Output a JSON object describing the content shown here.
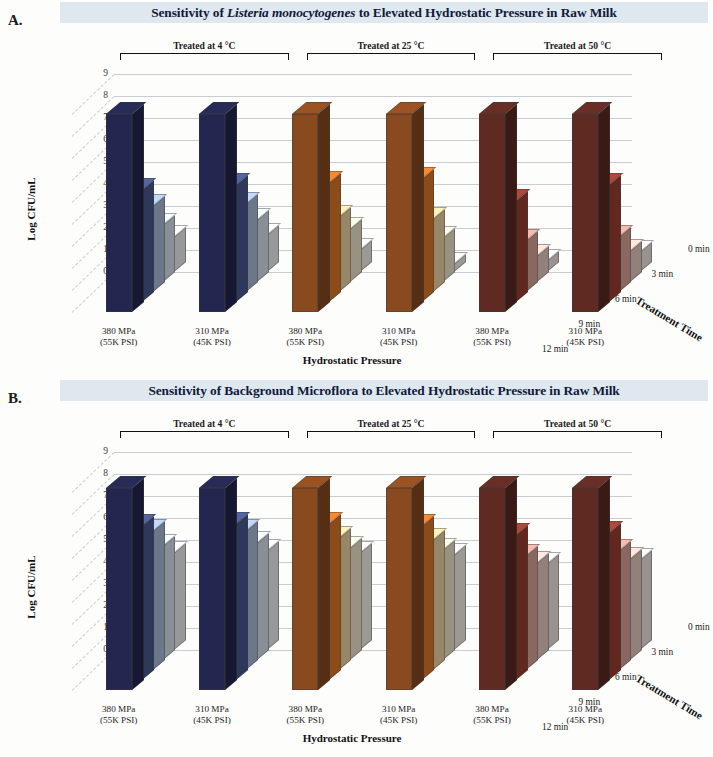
{
  "panels": [
    {
      "letter": "A.",
      "title_pre": "Sensitivity of ",
      "title_italic": "Listeria monocytogenes",
      "title_post": " to Elevated Hydrostatic Pressure in Raw Milk"
    },
    {
      "letter": "B.",
      "title_pre": "Sensitivity of Background Microflora to Elevated Hydrostatic Pressure in Raw Milk",
      "title_italic": "",
      "title_post": ""
    }
  ],
  "axes": {
    "y_title": "Log CFU/mL",
    "y_ticks": [
      "9",
      "8",
      "7",
      "6",
      "5",
      "4",
      "3",
      "2",
      "1",
      "0"
    ],
    "x_title": "Hydrostatic Pressure",
    "x_labels": [
      {
        "line1": "380 MPa",
        "line2": "(55K PSI)"
      },
      {
        "line1": "310 MPa",
        "line2": "(45K PSI)"
      },
      {
        "line1": "380 MPa",
        "line2": "(55K PSI)"
      },
      {
        "line1": "310 MPa",
        "line2": "(45K PSI)"
      },
      {
        "line1": "380 MPa",
        "line2": "(55K PSI)"
      },
      {
        "line1": "310 MPa",
        "line2": "(45K PSI)"
      }
    ],
    "z_title": "Treatment Time",
    "z_labels": [
      "0 min",
      "3 min",
      "6 min",
      "9 min",
      "12 min"
    ]
  },
  "temperature_groups": [
    {
      "label": "Treated at 4 °C"
    },
    {
      "label": "Treated at 25 °C"
    },
    {
      "label": "Treated at 50 °C"
    }
  ],
  "colors": {
    "title_band": "#dfe7ef",
    "title_text": "#101a3a",
    "grid": "#c9ccd2",
    "series_4C": [
      "#23264f",
      "#4a5a91",
      "#aec2de",
      "#dde7f2",
      "#f2f5f8"
    ],
    "series_25C": [
      "#8a4a20",
      "#e07a2a",
      "#f3d9a8",
      "#f7ecd4",
      "#faf6ee"
    ],
    "series_50C": [
      "#5e2a22",
      "#9e4034",
      "#dba89c",
      "#eccfc6",
      "#f6ece8"
    ]
  },
  "chart_data": [
    {
      "type": "bar",
      "title": "Sensitivity of Listeria monocytogenes to Elevated Hydrostatic Pressure in Raw Milk",
      "xlabel": "Hydrostatic Pressure",
      "ylabel": "Log CFU/mL",
      "zlabel": "Treatment Time",
      "ylim": [
        0,
        9
      ],
      "grid": true,
      "categories": [
        "4 °C / 380 MPa (55K PSI)",
        "4 °C / 310 MPa (45K PSI)",
        "25 °C / 380 MPa (55K PSI)",
        "25 °C / 310 MPa (45K PSI)",
        "50 °C / 380 MPa (55K PSI)",
        "50 °C / 310 MPa (45K PSI)"
      ],
      "series": [
        {
          "name": "0 min",
          "values": [
            9.0,
            9.0,
            9.0,
            9.0,
            9.0,
            9.0
          ]
        },
        {
          "name": "3 min",
          "values": [
            5.1,
            5.3,
            5.4,
            5.6,
            4.6,
            5.3
          ]
        },
        {
          "name": "6 min",
          "values": [
            3.9,
            4.0,
            3.4,
            3.3,
            2.3,
            2.5
          ]
        },
        {
          "name": "9 min",
          "values": [
            2.6,
            2.8,
            2.4,
            2.0,
            1.2,
            1.4
          ]
        },
        {
          "name": "12 min",
          "values": [
            1.6,
            1.7,
            1.0,
            0.35,
            0.5,
            0.9
          ]
        }
      ]
    },
    {
      "type": "bar",
      "title": "Sensitivity of Background Microflora to Elevated Hydrostatic Pressure in Raw Milk",
      "xlabel": "Hydrostatic Pressure",
      "ylabel": "Log CFU/mL",
      "zlabel": "Treatment Time",
      "ylim": [
        0,
        9
      ],
      "grid": true,
      "categories": [
        "4 °C / 380 MPa (55K PSI)",
        "4 °C / 310 MPa (45K PSI)",
        "25 °C / 380 MPa (55K PSI)",
        "25 °C / 310 MPa (45K PSI)",
        "50 °C / 380 MPa (55K PSI)",
        "50 °C / 310 MPa (45K PSI)"
      ],
      "series": [
        {
          "name": "0 min",
          "values": [
            9.2,
            9.2,
            9.2,
            9.2,
            9.2,
            9.2
          ]
        },
        {
          "name": "3 min",
          "values": [
            7.0,
            7.1,
            7.1,
            7.0,
            6.6,
            6.7
          ]
        },
        {
          "name": "6 min",
          "values": [
            6.3,
            6.3,
            6.0,
            5.9,
            5.2,
            5.4
          ]
        },
        {
          "name": "9 min",
          "values": [
            5.2,
            5.3,
            5.1,
            5.0,
            4.4,
            4.6
          ]
        },
        {
          "name": "12 min",
          "values": [
            4.4,
            4.5,
            4.4,
            4.3,
            3.9,
            4.1
          ]
        }
      ]
    }
  ]
}
